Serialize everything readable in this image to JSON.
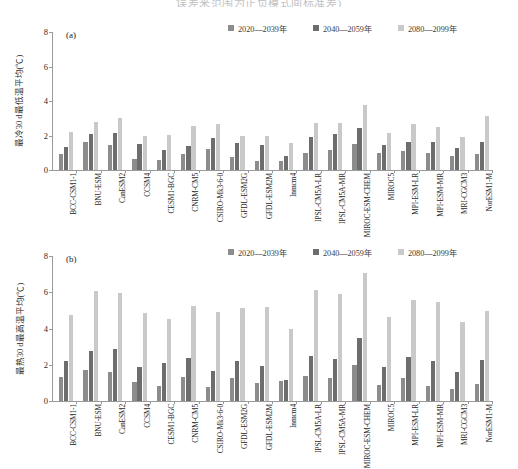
{
  "document": {
    "title": "误差来范围为正负模式间标准差)"
  },
  "legend": {
    "items": [
      {
        "label": "2020—2039年",
        "color": "#8c8c8c"
      },
      {
        "label": "2040—2059年",
        "color": "#6d6d6d"
      },
      {
        "label": "2080—2099年",
        "color": "#c9c9c9"
      }
    ]
  },
  "models": [
    "BCC-CSM1-1",
    "BNU-ESM",
    "CanESM2",
    "CCSM4",
    "CESM1-BGC",
    "CNRM-CM5",
    "CSIRO-Mk3-6-0",
    "GFDL-ESM2G",
    "GFDL-ESM2M",
    "Inmcm4",
    "IPSL-CM5A-LR",
    "IPSL-CM5A-MR",
    "MIROC-ESM-CHEM",
    "MIROC5",
    "MPI-ESM-LR",
    "MPI-ESM-MR",
    "MRI-CGCM3",
    "NorESM1-M"
  ],
  "chart_data": [
    {
      "type": "bar",
      "panel": "(a)",
      "title": "",
      "xlabel": "",
      "ylabel": "最冷30 d最低温平均(℃)",
      "ylim": [
        0,
        8
      ],
      "yticks": [
        0,
        2,
        4,
        6,
        8
      ],
      "grid": false,
      "legend_position": "top-right",
      "categories": [
        "BCC-CSM1-1",
        "BNU-ESM",
        "CanESM2",
        "CCSM4",
        "CESM1-BGC",
        "CNRM-CM5",
        "CSIRO-Mk3-6-0",
        "GFDL-ESM2G",
        "GFDL-ESM2M",
        "Inmcm4",
        "IPSL-CM5A-LR",
        "IPSL-CM5A-MR",
        "MIROC-ESM-CHEM",
        "MIROC5",
        "MPI-ESM-LR",
        "MPI-ESM-MR",
        "MRI-CGCM3",
        "NorESM1-M"
      ],
      "series": [
        {
          "name": "2020—2039年",
          "color": "#8c8c8c",
          "values": [
            0.9,
            1.6,
            1.45,
            0.65,
            0.6,
            0.9,
            1.2,
            0.75,
            0.55,
            0.5,
            1.0,
            1.15,
            1.5,
            1.0,
            1.1,
            1.0,
            0.8,
            0.95
          ]
        },
        {
          "name": "2040—2059年",
          "color": "#6d6d6d",
          "values": [
            1.35,
            2.1,
            2.15,
            1.5,
            1.15,
            1.4,
            1.85,
            1.55,
            1.45,
            0.8,
            1.9,
            2.1,
            2.45,
            1.45,
            1.65,
            1.6,
            1.3,
            1.6
          ]
        },
        {
          "name": "2080—2099年",
          "color": "#c9c9c9",
          "values": [
            2.2,
            2.8,
            3.0,
            1.95,
            2.05,
            2.55,
            2.65,
            2.0,
            2.0,
            1.55,
            2.7,
            2.75,
            3.75,
            2.15,
            2.65,
            2.5,
            1.9,
            3.15
          ]
        }
      ]
    },
    {
      "type": "bar",
      "panel": "(b)",
      "title": "",
      "xlabel": "",
      "ylabel": "最热30 d最高温平均(℃)",
      "ylim": [
        0,
        8
      ],
      "yticks": [
        0,
        2,
        4,
        6,
        8
      ],
      "grid": false,
      "legend_position": "top-right",
      "categories": [
        "BCC-CSM1-1",
        "BNU-ESM",
        "CanESM2",
        "CCSM4",
        "CESM1-BGC",
        "CNRM-CM5",
        "CSIRO-Mk3-6-0",
        "GFDL-ESM2G",
        "GFDL-ESM2M",
        "Inmcm4",
        "IPSL-CM5A-LR",
        "IPSL-CM5A-MR",
        "MIROC-ESM-CHEM",
        "MIROC5",
        "MPI-ESM-LR",
        "MPI-ESM-MR",
        "MRI-CGCM3",
        "NorESM1-M"
      ],
      "series": [
        {
          "name": "2020—2039年",
          "color": "#8c8c8c",
          "values": [
            1.35,
            1.7,
            1.6,
            1.05,
            0.85,
            1.35,
            0.75,
            1.25,
            1.0,
            1.1,
            1.4,
            1.25,
            2.0,
            0.9,
            1.25,
            0.85,
            0.65,
            0.95
          ]
        },
        {
          "name": "2040—2059年",
          "color": "#6d6d6d",
          "values": [
            2.2,
            2.75,
            2.85,
            1.85,
            2.1,
            2.4,
            1.65,
            2.2,
            1.95,
            1.15,
            2.5,
            2.3,
            3.45,
            1.85,
            2.45,
            2.2,
            1.6,
            2.25
          ]
        },
        {
          "name": "2080—2099年",
          "color": "#c9c9c9",
          "values": [
            4.75,
            6.05,
            5.95,
            4.85,
            4.55,
            5.25,
            4.9,
            5.15,
            5.2,
            3.95,
            6.1,
            5.9,
            7.05,
            4.65,
            5.6,
            5.45,
            4.35,
            4.95
          ]
        }
      ]
    }
  ]
}
